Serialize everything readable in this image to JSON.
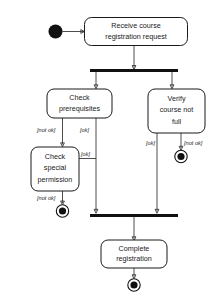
{
  "diagram": {
    "type": "uml-activity-diagram",
    "background_color": "#ffffff",
    "line_color": "#3a3a3a",
    "node_stroke_color": "#1a1a1a",
    "bar_color": "#111111",
    "nodes": {
      "start": {
        "name": "start-node",
        "kind": "initial"
      },
      "receive": {
        "name": "receive-course-registration-request",
        "kind": "activity",
        "line1": "Receive course",
        "line2": "registration request"
      },
      "fork": {
        "name": "fork-bar",
        "kind": "fork"
      },
      "check_prereq": {
        "name": "check-prerequisites",
        "kind": "activity",
        "line1": "Check",
        "line2": "prerequisites"
      },
      "verify_full": {
        "name": "verify-course-not-full",
        "kind": "activity",
        "line1": "Verify",
        "line2": "course not",
        "line3": "full"
      },
      "check_special": {
        "name": "check-special-permission",
        "kind": "activity",
        "line1": "Check",
        "line2": "special",
        "line3": "permission"
      },
      "join": {
        "name": "join-bar",
        "kind": "join"
      },
      "complete": {
        "name": "complete-registration",
        "kind": "activity",
        "line1": "Complete",
        "line2": "registration"
      },
      "end_special": {
        "name": "end-node-special-permission-denied",
        "kind": "final"
      },
      "end_full": {
        "name": "end-node-course-full",
        "kind": "final"
      },
      "end_complete": {
        "name": "end-node-registration-complete",
        "kind": "final"
      }
    },
    "guards": {
      "prereq_not_ok": "[not ok]",
      "prereq_ok": "[ok]",
      "special_ok": "[ok]",
      "special_not_ok": "[not ok]",
      "verify_ok": "[ok]",
      "verify_not_ok": "[not ok]"
    }
  }
}
